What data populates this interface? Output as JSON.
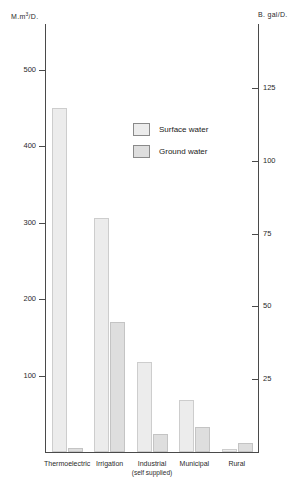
{
  "chart_data": {
    "type": "bar",
    "title": "",
    "xlabel": "",
    "ylabel": "M.m³/D.",
    "y2label": "B. gal/D.",
    "grid": false,
    "legend_position": "inside-top-center",
    "categories": [
      "Thermoelectric",
      "Irrigation",
      "Industrial",
      "Municipal",
      "Rural"
    ],
    "category_sublabels": [
      "",
      "",
      "(self supplied)",
      "",
      ""
    ],
    "series": [
      {
        "name": "Surface water",
        "color": "#ececec",
        "values": [
          450,
          306,
          118,
          68,
          4
        ]
      },
      {
        "name": "Ground water",
        "color": "#dedede",
        "values": [
          5,
          170,
          24,
          33,
          12
        ]
      }
    ],
    "ylim": [
      0,
      560
    ],
    "y2lim": [
      0,
      147
    ],
    "yticks": [
      100,
      200,
      300,
      400,
      500
    ],
    "yticklabels": [
      "100",
      "200",
      "300",
      "400",
      "500"
    ],
    "y2ticks": [
      25,
      50,
      75,
      100,
      125
    ],
    "y2ticklabels": [
      "25",
      "50",
      "75",
      "100",
      "125"
    ]
  },
  "axes": {
    "left_unit_prefix": "M.m",
    "left_unit_sup": "3",
    "left_unit_suffix": "/D.",
    "right_unit": "B. gal/D."
  },
  "legend": {
    "items": [
      {
        "label": "Surface water"
      },
      {
        "label": "Ground water"
      }
    ]
  }
}
